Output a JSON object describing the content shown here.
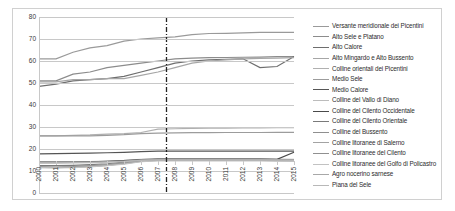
{
  "chart_data": {
    "type": "line",
    "title": "",
    "xlabel": "",
    "ylabel": "",
    "grid": true,
    "legend_position": "right",
    "ylim": [
      0,
      80
    ],
    "yticks": [
      0,
      10,
      20,
      30,
      40,
      50,
      60,
      70,
      80
    ],
    "categories": [
      "2000",
      "2001",
      "2002",
      "2003",
      "2004",
      "2005",
      "2006",
      "2007",
      "2008",
      "2009",
      "2010",
      "2011",
      "2012",
      "2013",
      "2014",
      "2015"
    ],
    "annotations": [
      {
        "type": "vertical-reference-line",
        "x": "2007.5",
        "style": "dash-dot",
        "color": "#222222"
      }
    ],
    "series": [
      {
        "name": "Versante meridionale dei Picentini",
        "color": "#9a9a9a",
        "values": [
          61,
          61,
          64,
          66,
          67,
          69,
          70,
          70.5,
          71,
          72,
          72.5,
          72.6,
          72.8,
          73,
          73,
          73
        ]
      },
      {
        "name": "Alto Sele e Platano",
        "color": "#8c8c8c",
        "values": [
          51,
          51,
          54,
          55,
          57,
          58,
          59,
          60,
          61,
          61.3,
          61.5,
          61.6,
          61.7,
          61.8,
          62,
          62
        ]
      },
      {
        "name": "Alto Calore",
        "color": "#6e6e6e",
        "values": [
          48.5,
          49.5,
          51,
          51.5,
          52,
          53,
          55,
          57,
          59,
          60,
          60.5,
          60.8,
          61,
          57,
          57.5,
          62
        ]
      },
      {
        "name": "Alto Mingardo e Alto Bussento",
        "color": "#a6a6a6",
        "values": [
          50.5,
          50.5,
          51.5,
          51.5,
          52,
          52,
          53.5,
          55,
          57,
          59,
          60,
          60.5,
          61,
          61.2,
          61.3,
          61.5
        ]
      },
      {
        "name": "Colline orientali dei Picentini",
        "color": "#b0b0b0",
        "values": [
          26,
          26,
          26.2,
          26.4,
          26.8,
          27,
          27.5,
          29,
          29.2,
          29.4,
          29.5,
          29.5,
          29.6,
          29.6,
          29.7,
          29.7
        ]
      },
      {
        "name": "Medio Sele",
        "color": "#9c9c9c",
        "values": [
          26,
          26,
          26,
          26,
          26.2,
          26.5,
          27,
          27.2,
          27.3,
          27.4,
          27.4,
          27.5,
          27.5,
          27.5,
          27.6,
          27.6
        ]
      },
      {
        "name": "Medio Calore",
        "color": "#555555",
        "values": [
          17.8,
          17.9,
          18,
          18.1,
          18.3,
          18.5,
          18.8,
          19,
          19,
          19,
          19,
          19,
          19,
          19,
          19,
          19
        ]
      },
      {
        "name": "Colline del Vallo di Diano",
        "color": "#bcbcbc",
        "values": [
          14,
          14,
          14.2,
          14.3,
          14.5,
          14.8,
          15.3,
          15.5,
          15.5,
          15.5,
          15.5,
          15.5,
          15.5,
          15.5,
          15.4,
          15.3
        ]
      },
      {
        "name": "Colline del Cilento Occidentale",
        "color": "#4a4a4a",
        "values": [
          14,
          14,
          14.1,
          14.2,
          14.4,
          14.7,
          15.2,
          15.4,
          15.4,
          15.4,
          15.4,
          15.4,
          15.4,
          15.4,
          15.3,
          18.5
        ]
      },
      {
        "name": "Colline del Cilento Orientale",
        "color": "#7a7a7a",
        "values": [
          12.5,
          12.4,
          12.6,
          12.9,
          13.3,
          14,
          15,
          15.3,
          15.3,
          15.3,
          15.3,
          15.3,
          15.3,
          15.3,
          15.2,
          15.1
        ]
      },
      {
        "name": "Colline del Bussento",
        "color": "#8f8f8f",
        "values": [
          12,
          11.8,
          12,
          12.4,
          12.9,
          13.7,
          14.8,
          15.1,
          15.1,
          15.1,
          15.1,
          15.1,
          15.1,
          15.1,
          15,
          15
        ]
      },
      {
        "name": "Colline litoranee di Salerno",
        "color": "#a3a3a3",
        "values": [
          11.8,
          11.6,
          11.8,
          12.2,
          12.7,
          13.5,
          14.6,
          15,
          15,
          15,
          15,
          15,
          15,
          15,
          14.9,
          14.8
        ]
      },
      {
        "name": "Colline litoranee del Cilento",
        "color": "#9090 90",
        "values": [
          11.6,
          11.5,
          11.7,
          12,
          12.6,
          13.3,
          14.4,
          14.8,
          14.8,
          14.8,
          14.8,
          14.8,
          14.8,
          14.8,
          14.7,
          14.6
        ]
      },
      {
        "name": "Colline litoranee del Golfo di Policastro",
        "color": "#c2c2c2",
        "values": [
          11.5,
          11.4,
          11.5,
          11.9,
          12.4,
          13.1,
          14.2,
          14.6,
          14.6,
          14.6,
          14.6,
          14.6,
          14.6,
          14.6,
          14.5,
          14.4
        ]
      },
      {
        "name": "Agro nocerino sarnese",
        "color": "#a8a8a8",
        "values": [
          13.8,
          13.8,
          13.9,
          14,
          14.2,
          14.5,
          15,
          15.2,
          15.2,
          15.2,
          15.2,
          15.2,
          15.2,
          15.2,
          15.1,
          15
        ]
      },
      {
        "name": "Piana del Sele",
        "color": "#b8b8b8",
        "values": [
          13.6,
          13.6,
          13.7,
          13.8,
          14,
          14.3,
          14.8,
          15,
          15,
          15,
          15,
          15,
          15,
          15,
          14.9,
          14.8
        ]
      }
    ]
  }
}
